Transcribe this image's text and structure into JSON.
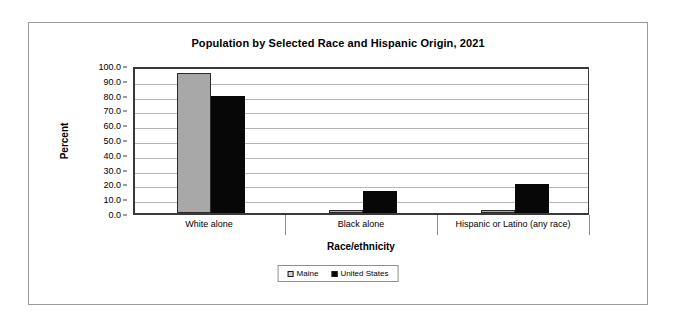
{
  "chart_data": {
    "type": "bar",
    "title": "Population by Selected Race and Hispanic Origin, 2021",
    "xlabel": "Race/ethnicity",
    "ylabel": "Percent",
    "ylim": [
      0,
      100
    ],
    "ytick_step": 10,
    "ytick_labels": [
      "100.0",
      "90.0",
      "80.0",
      "70.0",
      "60.0",
      "50.0",
      "40.0",
      "30.0",
      "20.0",
      "10.0",
      "0.0"
    ],
    "categories": [
      "White alone",
      "Black alone",
      "Hispanic or Latino (any race)"
    ],
    "series": [
      {
        "name": "Maine",
        "color": "#a8a8a8",
        "values": [
          94.4,
          1.9,
          2.1
        ]
      },
      {
        "name": "United States",
        "color": "#070707",
        "values": [
          78.9,
          15.2,
          19.5
        ]
      }
    ],
    "legend_position": "bottom",
    "grid": true
  }
}
